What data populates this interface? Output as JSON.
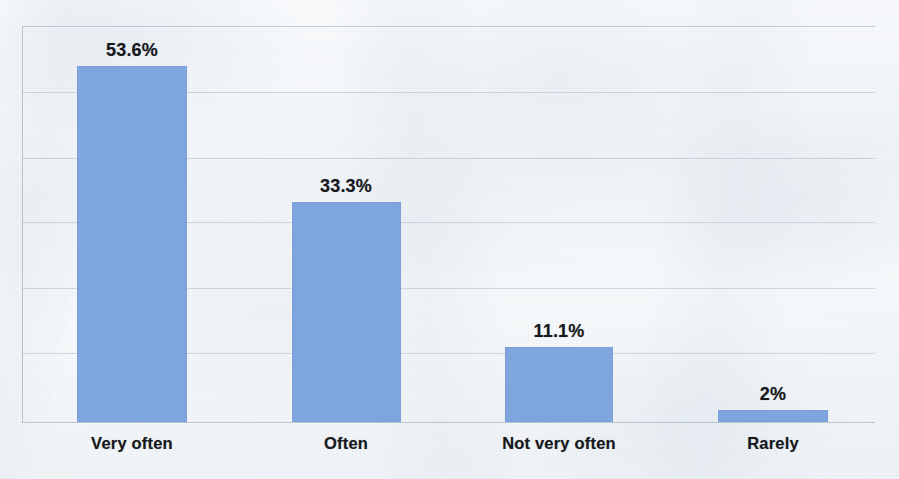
{
  "chart_data": {
    "type": "bar",
    "title": "",
    "subtitle": "",
    "xlabel": "",
    "ylabel": "",
    "categories": [
      "Very often",
      "Often",
      "Not very often",
      "Rarely"
    ],
    "values": [
      53.6,
      33.3,
      11.1,
      2
    ],
    "value_labels": [
      "53.6%",
      "33.3%",
      "11.1%",
      "2%"
    ],
    "ylim": [
      0,
      60
    ],
    "grid": true,
    "gridlines": [
      10,
      20,
      30,
      40,
      50
    ],
    "tick_labels": [],
    "legend": [],
    "legend_position": "none",
    "annotations": [],
    "series": [
      {
        "name": "Response share",
        "values": [
          53.6,
          33.3,
          11.1,
          2
        ],
        "color": "#7FA5DE"
      }
    ],
    "colors": {
      "bar": "#7FA5DE",
      "bar_edge": "#789CD6",
      "label_text": "#16181C",
      "gridline": "#B0BECD",
      "axis": "#AAB8C8",
      "background": "#F3F5F7"
    }
  },
  "bars": [
    {
      "category": "Very often",
      "value_label": "53.6%",
      "left": 77,
      "width": 110,
      "top": 66,
      "label_center": 132
    },
    {
      "category": "Often",
      "value_label": "33.3%",
      "left": 292,
      "width": 109,
      "top": 202,
      "label_center": 346
    },
    {
      "category": "Not very often",
      "value_label": "11.1%",
      "left": 505,
      "width": 108,
      "top": 347,
      "label_center": 559
    },
    {
      "category": "Rarely",
      "value_label": "2%",
      "left": 718,
      "width": 110,
      "top": 410,
      "label_center": 773
    }
  ],
  "gridline_positions": [
    92,
    158,
    222,
    288,
    353
  ]
}
